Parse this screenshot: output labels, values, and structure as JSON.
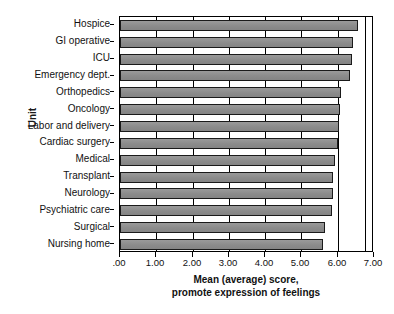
{
  "chart_data": {
    "type": "bar",
    "orientation": "horizontal",
    "title": "",
    "xlabel_line1": "Mean (average) score,",
    "xlabel_line2": "promote expression of feelings",
    "ylabel": "Unit",
    "xlim": [
      0,
      7
    ],
    "xticks": [
      0,
      1,
      2,
      3,
      4,
      5,
      6,
      7
    ],
    "xticklabels": [
      ".00",
      "1.00",
      "2.00",
      "3.00",
      "4.00",
      "5.00",
      "6.00",
      "7.00"
    ],
    "grid": true,
    "grid_axis": "x",
    "legend": "none",
    "bar_color": "#8e8e8e",
    "bar_edge_color": "#1a1a1a",
    "categories": [
      "Hospice",
      "GI operative",
      "ICU",
      "Emergency dept.",
      "Orthopedics",
      "Oncology",
      "Labor and delivery",
      "Cardiac surgery",
      "Medical",
      "Transplant",
      "Neurology",
      "Psychiatric care",
      "Surgical",
      "Nursing home"
    ],
    "values": [
      6.55,
      6.42,
      6.4,
      6.33,
      6.1,
      6.05,
      6.04,
      6.0,
      5.93,
      5.88,
      5.87,
      5.84,
      5.65,
      5.6
    ]
  }
}
